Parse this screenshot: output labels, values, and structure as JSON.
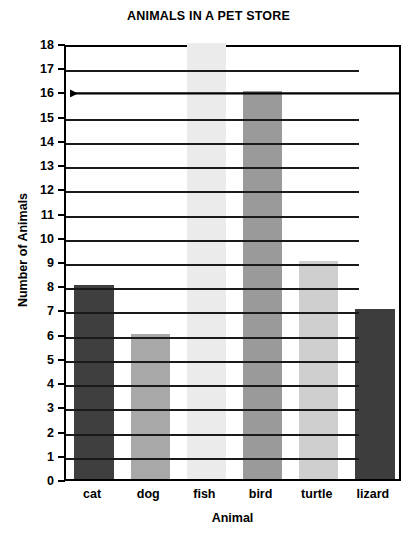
{
  "chart_data": {
    "type": "bar",
    "title": "ANIMALS IN A PET STORE",
    "xlabel": "Animal",
    "ylabel": "Number of Animals",
    "categories": [
      "cat",
      "dog",
      "fish",
      "bird",
      "turtle",
      "lizard"
    ],
    "values": [
      8,
      6,
      18,
      16,
      9,
      7
    ],
    "ylim": [
      0,
      18
    ],
    "ytick_step": 1,
    "yticks": [
      0,
      1,
      2,
      3,
      4,
      5,
      6,
      7,
      8,
      9,
      10,
      11,
      12,
      13,
      14,
      15,
      16,
      17,
      18
    ],
    "ytick_labels": [
      "0",
      "1",
      "2",
      "3",
      "4",
      "5",
      "6",
      "7",
      "8",
      "9",
      "10",
      "11",
      "12",
      "13",
      "14",
      "15",
      "16",
      "17",
      "18"
    ],
    "grid": true,
    "legend": false,
    "bar_colors": [
      "#3f3f3f",
      "#a8a8a8",
      "#ebebeb",
      "#9a9a9a",
      "#cfcfcf",
      "#3d3d3d"
    ],
    "annotations": [
      {
        "name": "arrow-at-16",
        "type": "arrow",
        "y_value": 16,
        "direction": "left",
        "description": "horizontal arrow pointing to the left at the value 16"
      }
    ],
    "colors": {
      "axis": "#000000",
      "gridline": "#1a1a1a",
      "background": "#ffffff",
      "text": "#000000"
    }
  }
}
